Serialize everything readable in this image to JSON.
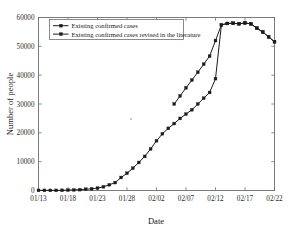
{
  "chart_data": {
    "type": "line",
    "title": "",
    "xlabel": "Date",
    "ylabel": "Number of people",
    "grid": false,
    "legend_position": "top-left",
    "ylim": [
      0,
      60000
    ],
    "yticks": [
      0,
      10000,
      20000,
      30000,
      40000,
      50000,
      60000
    ],
    "ytick_labels": [
      "0",
      "10000",
      "20000",
      "30000",
      "40000",
      "50000",
      "60000"
    ],
    "xticks": [
      "01/13",
      "01/18",
      "01/23",
      "01/28",
      "02/02",
      "02/07",
      "02/12",
      "02/17",
      "02/22"
    ],
    "x_day_range": [
      0,
      40
    ],
    "x_start_date": "01/13",
    "marker": "square",
    "series": [
      {
        "name": "Existing confirmed cases",
        "x": [
          "01/13",
          "01/14",
          "01/15",
          "01/16",
          "01/17",
          "01/18",
          "01/19",
          "01/20",
          "01/21",
          "01/22",
          "01/23",
          "01/24",
          "01/25",
          "01/26",
          "01/27",
          "01/28",
          "01/29",
          "01/30",
          "01/31",
          "02/01",
          "02/02",
          "02/03",
          "02/04",
          "02/05",
          "02/06",
          "02/07",
          "02/08",
          "02/09",
          "02/10",
          "02/11",
          "02/12",
          "02/13",
          "02/14",
          "02/15",
          "02/16",
          "02/17",
          "02/18",
          "02/19",
          "02/20",
          "02/21",
          "02/22"
        ],
        "values": [
          41,
          41,
          41,
          45,
          62,
          121,
          198,
          291,
          440,
          571,
          830,
          1287,
          1975,
          2744,
          4515,
          5974,
          7736,
          9720,
          11821,
          14411,
          17238,
          19665,
          21558,
          23214,
          25000,
          26500,
          28000,
          30000,
          32000,
          34000,
          38800,
          57416,
          57934,
          58016,
          57805,
          58097,
          57805,
          56303,
          54965,
          53284,
          51606
        ]
      },
      {
        "name": "Existing confirmed cases revised in the literature",
        "x": [
          "02/05",
          "02/06",
          "02/07",
          "02/08",
          "02/09",
          "02/10",
          "02/11",
          "02/12",
          "02/13",
          "02/14",
          "02/15",
          "02/16",
          "02/17",
          "02/18",
          "02/19",
          "02/20",
          "02/21",
          "02/22"
        ],
        "values": [
          30000,
          32800,
          35600,
          38300,
          41000,
          43800,
          46600,
          52000,
          57416,
          57934,
          58016,
          57805,
          58097,
          57805,
          56303,
          54965,
          53284,
          51606
        ]
      }
    ]
  },
  "legend": {
    "entries": [
      {
        "label": "Existing confirmed cases"
      },
      {
        "label": "Existing confirmed cases revised in the literature"
      }
    ]
  }
}
